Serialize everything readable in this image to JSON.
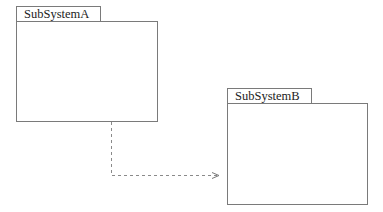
{
  "diagram": {
    "type": "UML package diagram",
    "packages": [
      {
        "id": "A",
        "name": "SubSystemA"
      },
      {
        "id": "B",
        "name": "SubSystemB"
      }
    ],
    "dependencies": [
      {
        "from": "SubSystemA",
        "to": "SubSystemB",
        "style": "dashed",
        "arrow": "open"
      }
    ]
  },
  "colors": {
    "line": "#7a7a7a",
    "dash": "#8a8a8a",
    "text": "#222222",
    "background": "#ffffff"
  }
}
